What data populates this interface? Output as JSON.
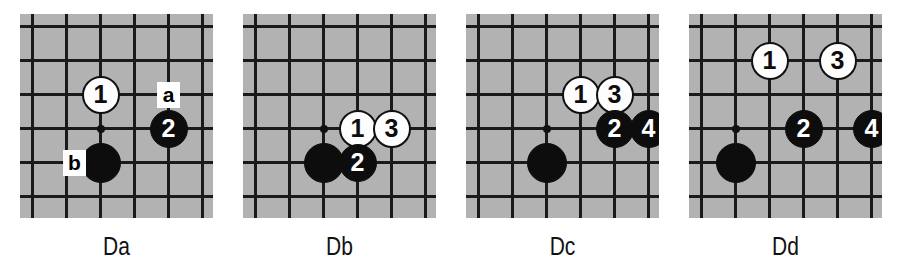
{
  "figure": {
    "background_color": "#ffffff",
    "board_color": "#b2b2b2",
    "line_color": "#1a1a1a",
    "black_stone_color": "#0d0d0d",
    "white_stone_color": "#fdfdfd"
  },
  "panels": [
    {
      "id": "Da",
      "caption": "Da",
      "left": 20,
      "board_width": 193,
      "board_height": 204,
      "caption_left": 20,
      "caption_top": 232,
      "caption_width": 193,
      "grid": {
        "cols": 6,
        "rows": 6,
        "x0": 11,
        "y0": 11,
        "step": 34
      },
      "star_point": {
        "col": 2,
        "row": 3
      },
      "stones": [
        {
          "name": "black-stone-corner",
          "color": "black",
          "label": "",
          "col": 2,
          "row": 4,
          "size": 40
        },
        {
          "name": "white-stone-1",
          "color": "white",
          "label": "1",
          "col": 2,
          "row": 2,
          "size": 38
        },
        {
          "name": "black-stone-2",
          "color": "black",
          "label": "2",
          "col": 4,
          "row": 3,
          "size": 38
        }
      ],
      "markers": [
        {
          "name": "point-label-a",
          "label": "a",
          "col": 4,
          "row": 2,
          "width": 23,
          "height": 26
        },
        {
          "name": "point-label-b",
          "label": "b",
          "col": 1,
          "row": 4,
          "width": 23,
          "height": 26,
          "dx": 8
        }
      ]
    },
    {
      "id": "Db",
      "caption": "Db",
      "left": 243,
      "board_width": 193,
      "board_height": 204,
      "caption_left": 243,
      "caption_top": 232,
      "caption_width": 193,
      "grid": {
        "cols": 6,
        "rows": 6,
        "x0": 11,
        "y0": 11,
        "step": 34
      },
      "star_point": {
        "col": 2,
        "row": 3
      },
      "stones": [
        {
          "name": "black-stone-corner",
          "color": "black",
          "label": "",
          "col": 2,
          "row": 4,
          "size": 40
        },
        {
          "name": "white-stone-1",
          "color": "white",
          "label": "1",
          "col": 3,
          "row": 3,
          "size": 38
        },
        {
          "name": "black-stone-2",
          "color": "black",
          "label": "2",
          "col": 3,
          "row": 4,
          "size": 38
        },
        {
          "name": "white-stone-3",
          "color": "white",
          "label": "3",
          "col": 4,
          "row": 3,
          "size": 38
        }
      ],
      "markers": []
    },
    {
      "id": "Dc",
      "caption": "Dc",
      "left": 466,
      "board_width": 193,
      "board_height": 204,
      "caption_left": 466,
      "caption_top": 232,
      "caption_width": 193,
      "grid": {
        "cols": 6,
        "rows": 6,
        "x0": 11,
        "y0": 11,
        "step": 34
      },
      "star_point": {
        "col": 2,
        "row": 3
      },
      "stones": [
        {
          "name": "black-stone-corner",
          "color": "black",
          "label": "",
          "col": 2,
          "row": 4,
          "size": 40
        },
        {
          "name": "white-stone-1",
          "color": "white",
          "label": "1",
          "col": 3,
          "row": 2,
          "size": 38
        },
        {
          "name": "white-stone-3",
          "color": "white",
          "label": "3",
          "col": 4,
          "row": 2,
          "size": 38
        },
        {
          "name": "black-stone-2",
          "color": "black",
          "label": "2",
          "col": 4,
          "row": 3,
          "size": 38
        },
        {
          "name": "black-stone-4",
          "color": "black",
          "label": "4",
          "col": 5,
          "row": 3,
          "size": 38
        }
      ],
      "markers": []
    },
    {
      "id": "Dd",
      "caption": "Dd",
      "left": 689,
      "board_width": 193,
      "board_height": 204,
      "caption_left": 689,
      "caption_top": 232,
      "caption_width": 193,
      "grid": {
        "cols": 6,
        "rows": 6,
        "x0": 11,
        "y0": 11,
        "step": 34
      },
      "star_point": {
        "col": 1,
        "row": 3
      },
      "stones": [
        {
          "name": "black-stone-corner",
          "color": "black",
          "label": "",
          "col": 1,
          "row": 4,
          "size": 40
        },
        {
          "name": "white-stone-1",
          "color": "white",
          "label": "1",
          "col": 2,
          "row": 1,
          "size": 38
        },
        {
          "name": "white-stone-3",
          "color": "white",
          "label": "3",
          "col": 4,
          "row": 1,
          "size": 38
        },
        {
          "name": "black-stone-2",
          "color": "black",
          "label": "2",
          "col": 3,
          "row": 3,
          "size": 38
        },
        {
          "name": "black-stone-4",
          "color": "black",
          "label": "4",
          "col": 5,
          "row": 3,
          "size": 38
        }
      ],
      "markers": []
    }
  ]
}
